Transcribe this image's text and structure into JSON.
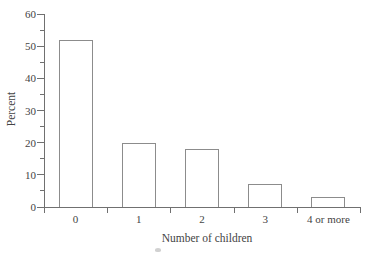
{
  "figure": {
    "background": "#ffffff",
    "axis_color": "#707070",
    "bar_border_color": "#8c8c8c",
    "bar_fill": "#ffffff",
    "text_color": "#444444"
  },
  "chart_data": {
    "type": "bar",
    "title": "",
    "categories": [
      "0",
      "1",
      "2",
      "3",
      "4 or more"
    ],
    "values": [
      52,
      20,
      18,
      7,
      3
    ],
    "xlabel": "Number of children",
    "ylabel": "Percent",
    "ylim": [
      0,
      60
    ],
    "ytick_step": 10,
    "yminor_tick_step": 5,
    "ytick_labels": [
      "0",
      "10",
      "20",
      "30",
      "40",
      "50",
      "60"
    ],
    "grid": false,
    "legend": "none",
    "bar_style": "outline-only"
  }
}
